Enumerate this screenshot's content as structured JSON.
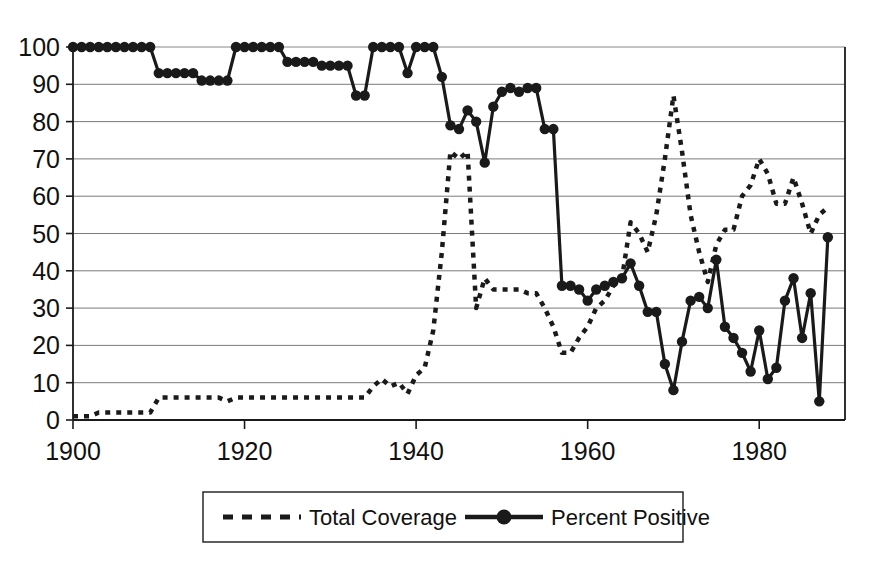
{
  "chart_data": {
    "type": "line",
    "title": "",
    "subtitle": "",
    "xlabel": "",
    "ylabel": "",
    "xlim": [
      1900,
      1990
    ],
    "ylim": [
      0,
      100
    ],
    "xticks": [
      1900,
      1920,
      1940,
      1960,
      1980
    ],
    "yticks": [
      0,
      10,
      20,
      30,
      40,
      50,
      60,
      70,
      80,
      90,
      100
    ],
    "grid": "horizontal",
    "legend_position": "bottom-center",
    "x": [
      1900,
      1901,
      1902,
      1903,
      1904,
      1905,
      1906,
      1907,
      1908,
      1909,
      1910,
      1911,
      1912,
      1913,
      1914,
      1915,
      1916,
      1917,
      1918,
      1919,
      1920,
      1921,
      1922,
      1923,
      1924,
      1925,
      1926,
      1927,
      1928,
      1929,
      1930,
      1931,
      1932,
      1933,
      1934,
      1935,
      1936,
      1937,
      1938,
      1939,
      1940,
      1941,
      1942,
      1943,
      1944,
      1945,
      1946,
      1947,
      1948,
      1949,
      1950,
      1951,
      1952,
      1953,
      1954,
      1955,
      1956,
      1957,
      1958,
      1959,
      1960,
      1961,
      1962,
      1963,
      1964,
      1965,
      1966,
      1967,
      1968,
      1969,
      1970,
      1971,
      1972,
      1973,
      1974,
      1975,
      1976,
      1977,
      1978,
      1979,
      1980,
      1981,
      1982,
      1983,
      1984,
      1985,
      1986,
      1987,
      1988
    ],
    "series": [
      {
        "name": "Total Coverage",
        "style": "dashed",
        "marker": "none",
        "color": "#1a1a1a",
        "values": [
          1,
          1,
          1,
          2,
          2,
          2,
          2,
          2,
          2,
          2,
          6,
          6,
          6,
          6,
          6,
          6,
          6,
          6,
          5,
          6,
          6,
          6,
          6,
          6,
          6,
          6,
          6,
          6,
          6,
          6,
          6,
          6,
          6,
          6,
          6,
          9,
          11,
          9,
          10,
          7,
          12,
          14,
          24,
          45,
          72,
          70,
          72,
          30,
          38,
          35,
          35,
          35,
          35,
          34,
          34,
          30,
          25,
          18,
          18,
          22,
          25,
          30,
          32,
          36,
          38,
          53,
          50,
          45,
          55,
          70,
          87,
          72,
          55,
          45,
          37,
          47,
          51,
          51,
          60,
          63,
          70,
          66,
          58,
          58,
          65,
          58,
          50,
          55,
          57
        ]
      },
      {
        "name": "Percent Positive",
        "style": "solid",
        "marker": "circle",
        "color": "#1a1a1a",
        "values": [
          100,
          100,
          100,
          100,
          100,
          100,
          100,
          100,
          100,
          100,
          93,
          93,
          93,
          93,
          93,
          91,
          91,
          91,
          91,
          100,
          100,
          100,
          100,
          100,
          100,
          96,
          96,
          96,
          96,
          95,
          95,
          95,
          95,
          87,
          87,
          100,
          100,
          100,
          100,
          93,
          100,
          100,
          100,
          92,
          79,
          78,
          83,
          80,
          69,
          84,
          88,
          89,
          88,
          89,
          89,
          78,
          78,
          36,
          36,
          35,
          32,
          35,
          36,
          37,
          38,
          42,
          36,
          29,
          29,
          15,
          8,
          21,
          32,
          33,
          30,
          43,
          25,
          22,
          18,
          13,
          24,
          11,
          14,
          32,
          38,
          22,
          34,
          5,
          49
        ]
      }
    ]
  },
  "axis": {
    "y_labels": [
      "100",
      "90",
      "80",
      "70",
      "60",
      "50",
      "40",
      "30",
      "20",
      "10",
      "0"
    ],
    "x_labels": [
      "1900",
      "1920",
      "1940",
      "1960",
      "1980"
    ]
  },
  "legend": {
    "items": [
      {
        "label": "Total Coverage",
        "style": "dashed"
      },
      {
        "label": "Percent Positive",
        "style": "solid-marker"
      }
    ]
  }
}
